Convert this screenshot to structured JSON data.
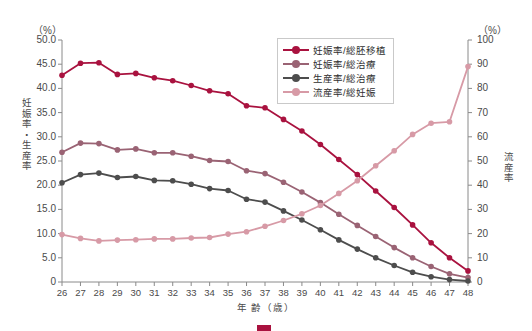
{
  "axes": {
    "left_unit": "（%）",
    "right_unit": "（%）",
    "left_title": "妊娠率・生産率",
    "right_title": "流産率",
    "x_title": "年 齢（歳）",
    "left_ticks": [
      "50.0",
      "45.0",
      "40.0",
      "35.0",
      "30.0",
      "25.0",
      "20.0",
      "15.0",
      "10.0",
      "5.0",
      "0"
    ],
    "right_ticks": [
      "100",
      "90",
      "80",
      "70",
      "60",
      "50",
      "40",
      "30",
      "20",
      "10",
      "0"
    ]
  },
  "legend": {
    "items": [
      {
        "label": "妊娠率/総胚移植",
        "color": "#a9123f"
      },
      {
        "label": "妊娠率/総治療",
        "color": "#9a6374"
      },
      {
        "label": "生産率/総治療",
        "color": "#4d4d4d"
      },
      {
        "label": "流産率/総妊娠",
        "color": "#d79aa6"
      }
    ]
  },
  "caption": "",
  "chart_data": {
    "type": "line",
    "title": "",
    "xlabel": "年 齢（歳）",
    "ylabel": "妊娠率・生産率",
    "y2label": "流産率",
    "xlim": [
      26,
      48
    ],
    "ylim": [
      0,
      50
    ],
    "y2lim": [
      0,
      100
    ],
    "grid": false,
    "legend_position": "top-right",
    "categories": [
      26,
      27,
      28,
      29,
      30,
      31,
      32,
      33,
      34,
      35,
      36,
      37,
      38,
      39,
      40,
      41,
      42,
      43,
      44,
      45,
      46,
      47,
      48
    ],
    "series": [
      {
        "name": "妊娠率/総胚移植",
        "color": "#a9123f",
        "axis": "left",
        "values": [
          42.7,
          45.2,
          45.3,
          42.9,
          43.1,
          42.2,
          41.6,
          40.6,
          39.5,
          38.9,
          36.4,
          36.0,
          33.6,
          31.2,
          28.4,
          25.3,
          22.2,
          18.8,
          15.4,
          11.8,
          8.1,
          5.0,
          2.3
        ]
      },
      {
        "name": "妊娠率/総治療",
        "color": "#9a6374",
        "axis": "left",
        "values": [
          26.8,
          28.7,
          28.6,
          27.3,
          27.5,
          26.7,
          26.7,
          26.0,
          25.1,
          24.9,
          23.0,
          22.4,
          20.6,
          18.6,
          16.4,
          14.0,
          11.7,
          9.4,
          7.1,
          5.0,
          3.2,
          1.7,
          0.9
        ]
      },
      {
        "name": "生産率/総治療",
        "color": "#4d4d4d",
        "axis": "left",
        "values": [
          20.5,
          22.2,
          22.5,
          21.6,
          21.8,
          21.0,
          20.9,
          20.2,
          19.3,
          18.9,
          17.1,
          16.5,
          14.7,
          12.8,
          10.8,
          8.7,
          6.8,
          5.0,
          3.4,
          2.0,
          1.1,
          0.5,
          0.2
        ]
      },
      {
        "name": "流産率/総妊娠",
        "color": "#d79aa6",
        "axis": "right",
        "values": [
          19.6,
          18.0,
          17.0,
          17.3,
          17.5,
          17.8,
          17.8,
          18.2,
          18.4,
          19.8,
          20.8,
          23.0,
          25.4,
          28.2,
          31.6,
          36.6,
          41.8,
          48.0,
          54.2,
          61.0,
          65.6,
          66.2,
          89.0
        ]
      }
    ]
  }
}
